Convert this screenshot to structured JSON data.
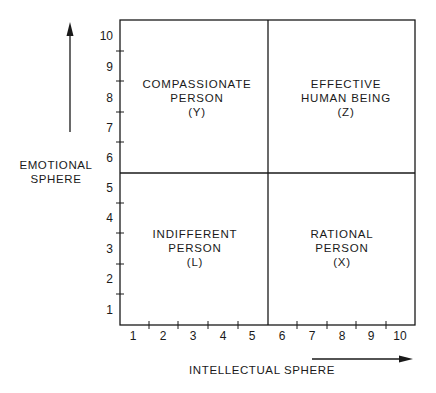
{
  "diagram": {
    "type": "quadrant",
    "y_axis": {
      "label_lines": [
        "EMOTIONAL",
        "SPHERE"
      ],
      "ticks": [
        "1",
        "2",
        "3",
        "4",
        "5",
        "6",
        "7",
        "8",
        "9",
        "10"
      ]
    },
    "x_axis": {
      "label": "INTELLECTUAL SPHERE",
      "ticks": [
        "1",
        "2",
        "3",
        "4",
        "5",
        "6",
        "7",
        "8",
        "9",
        "10"
      ]
    },
    "quadrants": {
      "top_left": {
        "lines": [
          "COMPASSIONATE",
          "PERSON",
          "(Y)"
        ]
      },
      "top_right": {
        "lines": [
          "EFFECTIVE",
          "HUMAN BEING",
          "(Z)"
        ]
      },
      "bottom_left": {
        "lines": [
          "INDIFFERENT",
          "PERSON",
          "(L)"
        ]
      },
      "bottom_right": {
        "lines": [
          "RATIONAL",
          "PERSON",
          "(X)"
        ]
      }
    },
    "colors": {
      "ink": "#1a1a1a",
      "background": "#ffffff"
    }
  }
}
